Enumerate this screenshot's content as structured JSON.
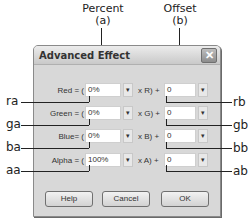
{
  "callouts": {
    "percent_title": "Percent",
    "percent_sub": "(a)",
    "offset_title": "Offset",
    "offset_sub": "(b)",
    "left": [
      "ra",
      "ga",
      "ba",
      "aa"
    ],
    "right": [
      "rb",
      "gb",
      "bb",
      "ab"
    ]
  },
  "dialog": {
    "title": "Advanced Effect",
    "close_glyph": "✕",
    "rows": [
      {
        "label": "Red = (",
        "percent": "0%",
        "mid": "x R) +",
        "offset": "0"
      },
      {
        "label": "Green = (",
        "percent": "0%",
        "mid": "x G) +",
        "offset": "0"
      },
      {
        "label": "Blue= (",
        "percent": "0%",
        "mid": "x B) +",
        "offset": "0"
      },
      {
        "label": "Alpha = (",
        "percent": "100%",
        "mid": "x A) +",
        "offset": "0"
      }
    ],
    "dropdown_glyph": "▾",
    "buttons": {
      "help": "Help",
      "cancel": "Cancel",
      "ok": "OK"
    }
  }
}
